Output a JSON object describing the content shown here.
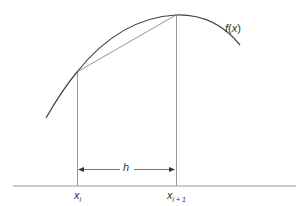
{
  "diagram": {
    "title": "",
    "function_label": {
      "name": "f",
      "arg": "x",
      "text": "f(x)"
    },
    "interval_label": "h",
    "points": [
      {
        "base": "x",
        "sub": "i",
        "text": "x_i"
      },
      {
        "base": "x",
        "sub": "i + 1",
        "text": "x_{i+1}"
      }
    ],
    "colors": {
      "curve": "#444444",
      "chord": "#888888",
      "verticals": "#888888",
      "axis": "#999999",
      "arrow": "#444444",
      "text": "#333333"
    }
  },
  "labels": {
    "fx_name": "f",
    "fx_open": "(",
    "fx_arg": "x",
    "fx_close": ")",
    "h": "h",
    "xi_base": "x",
    "xi_sub": "i",
    "xi1_base": "x",
    "xi1_sub": "i + 1"
  }
}
